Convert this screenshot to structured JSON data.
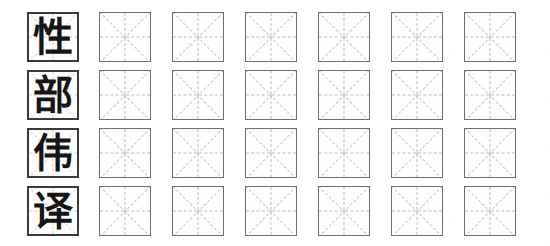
{
  "worksheet": {
    "title": "Chinese character handwriting practice sheet",
    "sheet_type": "mi-zi-ge character practice grid",
    "background_color": "#ffffff",
    "model_cell_border_color": "#3a3a3a",
    "practice_cell_border_color": "#6e6e72",
    "guide_line_color": "#bdbdc2",
    "ink_color": "#151515",
    "practice_cells_per_row": 6,
    "rows": [
      {
        "index": 1,
        "character": "性",
        "practice_cells": [
          "",
          "",
          "",
          "",
          "",
          ""
        ]
      },
      {
        "index": 2,
        "character": "部",
        "practice_cells": [
          "",
          "",
          "",
          "",
          "",
          ""
        ]
      },
      {
        "index": 3,
        "character": "伟",
        "practice_cells": [
          "",
          "",
          "",
          "",
          "",
          ""
        ]
      },
      {
        "index": 4,
        "character": "译",
        "practice_cells": [
          "",
          "",
          "",
          "",
          "",
          ""
        ]
      }
    ]
  }
}
